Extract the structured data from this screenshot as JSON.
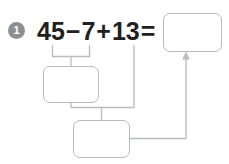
{
  "problem": {
    "number": "1",
    "badge_color": "#8f8f8f",
    "badge_text_color": "#ffffff"
  },
  "equation": {
    "full_text": "45−7+13=",
    "terms": [
      {
        "type": "number",
        "text": "45"
      },
      {
        "type": "operator",
        "text": "−"
      },
      {
        "type": "number",
        "text": "7"
      },
      {
        "type": "operator",
        "text": "+"
      },
      {
        "type": "number",
        "text": "13"
      },
      {
        "type": "operator",
        "text": "="
      }
    ],
    "text_color": "#231f20"
  },
  "boxes": {
    "result": {
      "label": "",
      "value": "",
      "placeholder": ""
    },
    "middle": {
      "label": "",
      "value": "",
      "placeholder": ""
    },
    "bottom": {
      "label": "",
      "value": "",
      "placeholder": ""
    }
  },
  "style": {
    "box_border_color": "#b9bbbd",
    "connector_color": "#b9bbbd",
    "background": "#ffffff"
  }
}
